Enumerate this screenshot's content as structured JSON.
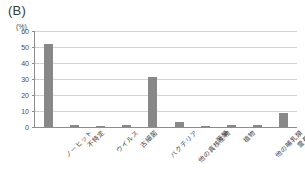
{
  "figure": {
    "panel_label": "(B)",
    "y_unit": "(%)"
  },
  "chart_data": {
    "type": "bar",
    "title": "(B)",
    "xlabel": "",
    "ylabel": "(%)",
    "ylim": [
      0,
      60
    ],
    "yticks": [
      0,
      10,
      20,
      30,
      40,
      50,
      60
    ],
    "grid": true,
    "legend": "none",
    "bar_color": "#888888",
    "categories": [
      "ノーヒット",
      "不特定",
      "ウイルス",
      "古細菌",
      "バクテリア",
      "他の真核生物",
      "菌類",
      "植物",
      "他の哺乳類",
      "霊長類"
    ],
    "values": [
      51.8,
      1.5,
      0.8,
      1.0,
      31.0,
      3.3,
      0.8,
      1.5,
      1.0,
      9.0
    ]
  }
}
